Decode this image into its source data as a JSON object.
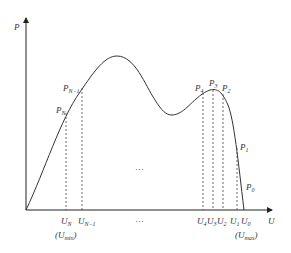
{
  "axes": {
    "y_label": "P",
    "x_label": "U"
  },
  "points": {
    "PN": {
      "base": "P",
      "sub": "N"
    },
    "PN1": {
      "base": "P",
      "sub": "N−1"
    },
    "P4": {
      "base": "P",
      "sub": "4"
    },
    "P3": {
      "base": "P",
      "sub": "3"
    },
    "P2": {
      "base": "P",
      "sub": "2"
    },
    "P1": {
      "base": "P",
      "sub": "1"
    },
    "P0": {
      "base": "P",
      "sub": "0"
    }
  },
  "ticks": {
    "UN": {
      "base": "U",
      "sub": "N"
    },
    "UN1": {
      "base": "U",
      "sub": "N−1"
    },
    "U4": {
      "base": "U",
      "sub": "4"
    },
    "U3": {
      "base": "U",
      "sub": "3"
    },
    "U2": {
      "base": "U",
      "sub": "2"
    },
    "U1": {
      "base": "U",
      "sub": "1"
    },
    "U0": {
      "base": "U",
      "sub": "0"
    }
  },
  "annotations": {
    "umin": {
      "open": "(",
      "base": "U",
      "sub": "min",
      "close": ")"
    },
    "umax": {
      "open": "(",
      "base": "U",
      "sub": "max",
      "close": ")"
    },
    "ellipsis_mid": "···",
    "ellipsis_axis": "···"
  }
}
